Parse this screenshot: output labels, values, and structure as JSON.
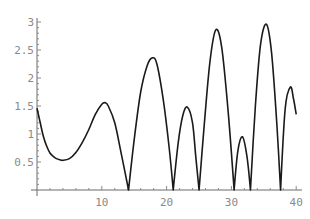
{
  "chart_data": {
    "type": "line",
    "title": "",
    "xlabel": "",
    "ylabel": "",
    "xlim": [
      0,
      40
    ],
    "ylim": [
      0,
      3
    ],
    "grid": false,
    "legend": null,
    "x_ticks": [
      "10",
      "20",
      "30",
      "40"
    ],
    "y_ticks": [
      "0.5",
      "1",
      "1.5",
      "2",
      "2.5",
      "3"
    ],
    "series": [
      {
        "name": "curve",
        "color": "#1a1a1a",
        "points": [
          [
            0,
            1.46
          ],
          [
            0.5,
            1.2
          ],
          [
            1,
            0.95
          ],
          [
            1.5,
            0.78
          ],
          [
            2,
            0.66
          ],
          [
            2.5,
            0.6
          ],
          [
            3,
            0.56
          ],
          [
            3.5,
            0.54
          ],
          [
            4,
            0.53
          ],
          [
            5,
            0.56
          ],
          [
            6,
            0.67
          ],
          [
            7,
            0.85
          ],
          [
            8,
            1.08
          ],
          [
            9,
            1.35
          ],
          [
            10,
            1.53
          ],
          [
            10.5,
            1.56
          ],
          [
            11,
            1.5
          ],
          [
            12,
            1.2
          ],
          [
            13,
            0.65
          ],
          [
            14.13,
            0
          ],
          [
            15,
            0.9
          ],
          [
            16,
            1.75
          ],
          [
            17,
            2.22
          ],
          [
            17.8,
            2.36
          ],
          [
            18.5,
            2.25
          ],
          [
            19.5,
            1.6
          ],
          [
            20.4,
            0.75
          ],
          [
            21.02,
            0
          ],
          [
            21.8,
            0.85
          ],
          [
            22.5,
            1.33
          ],
          [
            23.2,
            1.48
          ],
          [
            24,
            1.2
          ],
          [
            24.5,
            0.6
          ],
          [
            25.01,
            0
          ],
          [
            25.8,
            1.15
          ],
          [
            26.7,
            2.3
          ],
          [
            27.6,
            2.86
          ],
          [
            28.5,
            2.55
          ],
          [
            29.5,
            1.4
          ],
          [
            30.42,
            0
          ],
          [
            31,
            0.7
          ],
          [
            31.7,
            0.95
          ],
          [
            32.4,
            0.6
          ],
          [
            32.94,
            0
          ],
          [
            33.7,
            1.5
          ],
          [
            34.5,
            2.6
          ],
          [
            35.4,
            2.96
          ],
          [
            36.2,
            2.45
          ],
          [
            37,
            1.2
          ],
          [
            37.59,
            0
          ],
          [
            38.3,
            1.45
          ],
          [
            39.1,
            1.84
          ],
          [
            39.6,
            1.62
          ],
          [
            40,
            1.35
          ]
        ]
      }
    ]
  }
}
